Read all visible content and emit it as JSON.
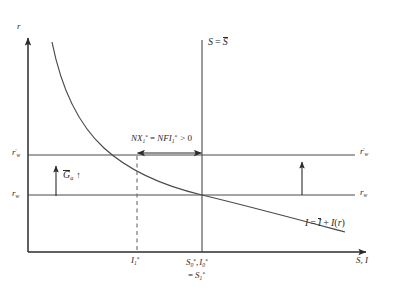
{
  "figure": {
    "type": "economics-loanable-funds-diagram",
    "background_color": "#ffffff",
    "line_color": "#3a3a3a",
    "text_color": "#2b2b2b"
  },
  "axes": {
    "y_axis_label": "r",
    "x_axis_label": "S, I",
    "origin_px": [
      28,
      252
    ],
    "x_axis_end_px": [
      372,
      252
    ],
    "y_axis_top_px": [
      28,
      33
    ]
  },
  "curves": {
    "investment": {
      "label_prefix": "I",
      "label_eq": "=",
      "label_bar_I": "I",
      "label_plus": "+",
      "label_func": "I",
      "label_open": "(",
      "label_arg": "r",
      "label_close": ")",
      "label_full": "I = Ī + I(r)"
    },
    "saving_vertical": {
      "label_S": "S",
      "label_eq": "=",
      "label_Sbar": "S",
      "label_full": "S = S̄",
      "x_px": 202
    }
  },
  "interest_rate_lines": [
    {
      "name": "world-rate-new",
      "label_base": "r",
      "label_sub": "w",
      "label_prime": "'",
      "label_full": "r'w",
      "y_px": 155
    },
    {
      "name": "world-rate-initial",
      "label_base": "r",
      "label_sub": "w",
      "label_full": "rw",
      "y_px": 195
    }
  ],
  "annotations": {
    "net_exports": {
      "part1": "NX",
      "part1_sub": "1",
      "part1_sup": "*",
      "eq": "=",
      "part2": "NFI",
      "part2_sub": "1",
      "part2_sup": "*",
      "compare": "> 0",
      "full": "NX1* = NFI1* > 0"
    },
    "government_spending": {
      "arrow_left": "↑",
      "symbol": "G",
      "symbol_sub": "a",
      "arrow_right": "↑",
      "full": "↑ Ḡa ↑"
    },
    "shift_arrow": {
      "name": "upward-shift-arrow",
      "glyph": "↑"
    }
  },
  "x_ticks": [
    {
      "name": "investment-1",
      "base": "I",
      "sub": "1",
      "sup": "*",
      "full": "I1*",
      "x_px": 137
    },
    {
      "name": "saving-investment-0",
      "line1_a": "S",
      "line1_a_sub": "0",
      "line1_a_sup": "*",
      "line1_comma": ",",
      "line1_b": "I",
      "line1_b_sub": "0",
      "line1_b_sup": "*",
      "line2_eq": "=",
      "line2_b": "S",
      "line2_b_sub": "1",
      "line2_b_sup": "*",
      "full_line1": "S0*, I0*",
      "full_line2": "= S1*",
      "x_px": 202
    }
  ]
}
